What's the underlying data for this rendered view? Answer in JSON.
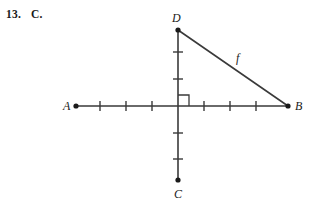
{
  "header": {
    "question_number": "13.",
    "answer_choice": "C."
  },
  "figure": {
    "name": "right-triangle-on-axes",
    "stroke_color": "#3a3a3a",
    "label_color": "#1a1a1a",
    "origin": {
      "x": 178,
      "y": 106
    },
    "points": [
      {
        "id": "A",
        "label": "A",
        "x": 76,
        "y": 106,
        "label_x": 63,
        "label_y": 110,
        "dot": true
      },
      {
        "id": "B",
        "label": "B",
        "x": 288,
        "y": 106,
        "label_x": 295,
        "label_y": 110,
        "dot": true
      },
      {
        "id": "C",
        "label": "C",
        "x": 178,
        "y": 180,
        "label_x": 174,
        "label_y": 198,
        "dot": true
      },
      {
        "id": "D",
        "label": "D",
        "x": 178,
        "y": 30,
        "label_x": 172,
        "label_y": 22,
        "dot": true
      }
    ],
    "segments": [
      {
        "id": "horizontal-axis",
        "from": "A",
        "to": "B",
        "label": ""
      },
      {
        "id": "vertical-axis",
        "from": "D",
        "to": "C",
        "label": ""
      },
      {
        "id": "hypotenuse",
        "from": "D",
        "to": "B",
        "label": "f",
        "label_x": 236,
        "label_y": 62
      }
    ],
    "ticks": {
      "horizontal_left": [
        100,
        126,
        152
      ],
      "horizontal_right": [
        204,
        230,
        256
      ],
      "vertical_up": [
        52,
        79
      ],
      "vertical_down": [
        133,
        159
      ],
      "half_length": 5
    },
    "right_angle_marker": {
      "quadrant": "upper-right",
      "size": 11
    }
  }
}
